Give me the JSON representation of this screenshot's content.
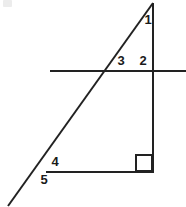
{
  "figure": {
    "canvas": {
      "width": 186,
      "height": 207,
      "background": "#ffffff"
    },
    "stroke_color": "#222222",
    "label_color": "#1a1a1a",
    "stroke_width": 2,
    "lines": [
      {
        "name": "transversal-line",
        "role": "transversal",
        "x1": 8,
        "y1": 206,
        "x2": 153,
        "y2": 3
      },
      {
        "name": "horizontal-line",
        "role": "horizontal-transversal",
        "x1": 50,
        "y1": 71,
        "x2": 186,
        "y2": 71
      },
      {
        "name": "vertical-line",
        "role": "triangle-right-side",
        "x1": 153,
        "y1": 3,
        "x2": 153,
        "y2": 172
      },
      {
        "name": "base-line",
        "role": "triangle-base",
        "x1": 46,
        "y1": 172,
        "x2": 154,
        "y2": 172
      }
    ],
    "right_angle_marker": {
      "name": "right-angle-square",
      "x": 136,
      "y": 155,
      "size": 16
    },
    "labels": [
      {
        "name": "angle-label-1",
        "text": "1",
        "x": 148,
        "y": 21
      },
      {
        "name": "angle-label-3",
        "text": "3",
        "x": 121,
        "y": 62
      },
      {
        "name": "angle-label-2",
        "text": "2",
        "x": 143,
        "y": 62
      },
      {
        "name": "angle-label-4",
        "text": "4",
        "x": 55,
        "y": 163
      },
      {
        "name": "angle-label-5",
        "text": "5",
        "x": 44,
        "y": 181
      }
    ]
  }
}
